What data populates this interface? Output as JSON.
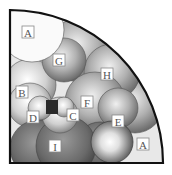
{
  "diagram": {
    "type": "sphere-packing-quarter-circle",
    "labels": {
      "A_top": "A",
      "G": "G",
      "H": "H",
      "B": "B",
      "F": "F",
      "D": "D",
      "C": "C",
      "E": "E",
      "I": "I",
      "A_right": "A"
    }
  }
}
